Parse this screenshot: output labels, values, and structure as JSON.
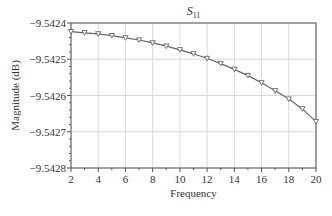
{
  "chart_data": {
    "type": "line",
    "title": "S11",
    "title_main": "S",
    "title_sub": "11",
    "xlabel": "Frequency",
    "ylabel": "Magnitude (dB)",
    "xlim": [
      2,
      20
    ],
    "ylim": [
      -9.5428,
      -9.5424
    ],
    "x_ticks": [
      2,
      4,
      6,
      8,
      10,
      12,
      14,
      16,
      18,
      20
    ],
    "y_ticks": [
      -9.5424,
      -9.5425,
      -9.5426,
      -9.5427,
      -9.5428
    ],
    "x_tick_labels": [
      "2",
      "4",
      "6",
      "8",
      "10",
      "12",
      "14",
      "16",
      "18",
      "20"
    ],
    "y_tick_labels": [
      "−9.5424",
      "−9.5425",
      "−9.5426",
      "−9.5427",
      "−9.5428"
    ],
    "grid": true,
    "marker": "down-triangle",
    "series": [
      {
        "name": "S11",
        "color": "#666666",
        "x": [
          2,
          3,
          4,
          5,
          6,
          7,
          8,
          9,
          10,
          11,
          12,
          13,
          14,
          15,
          16,
          17,
          18,
          19,
          20
        ],
        "values": [
          -9.542424,
          -9.542427,
          -9.54243,
          -9.542435,
          -9.542441,
          -9.542447,
          -9.542455,
          -9.542464,
          -9.542474,
          -9.542485,
          -9.542498,
          -9.542512,
          -9.542528,
          -9.542545,
          -9.542565,
          -9.542587,
          -9.54261,
          -9.542637,
          -9.542672
        ]
      }
    ]
  },
  "colors": {
    "axis": "#555555",
    "grid": "#d9d9d9",
    "line": "#666666"
  }
}
